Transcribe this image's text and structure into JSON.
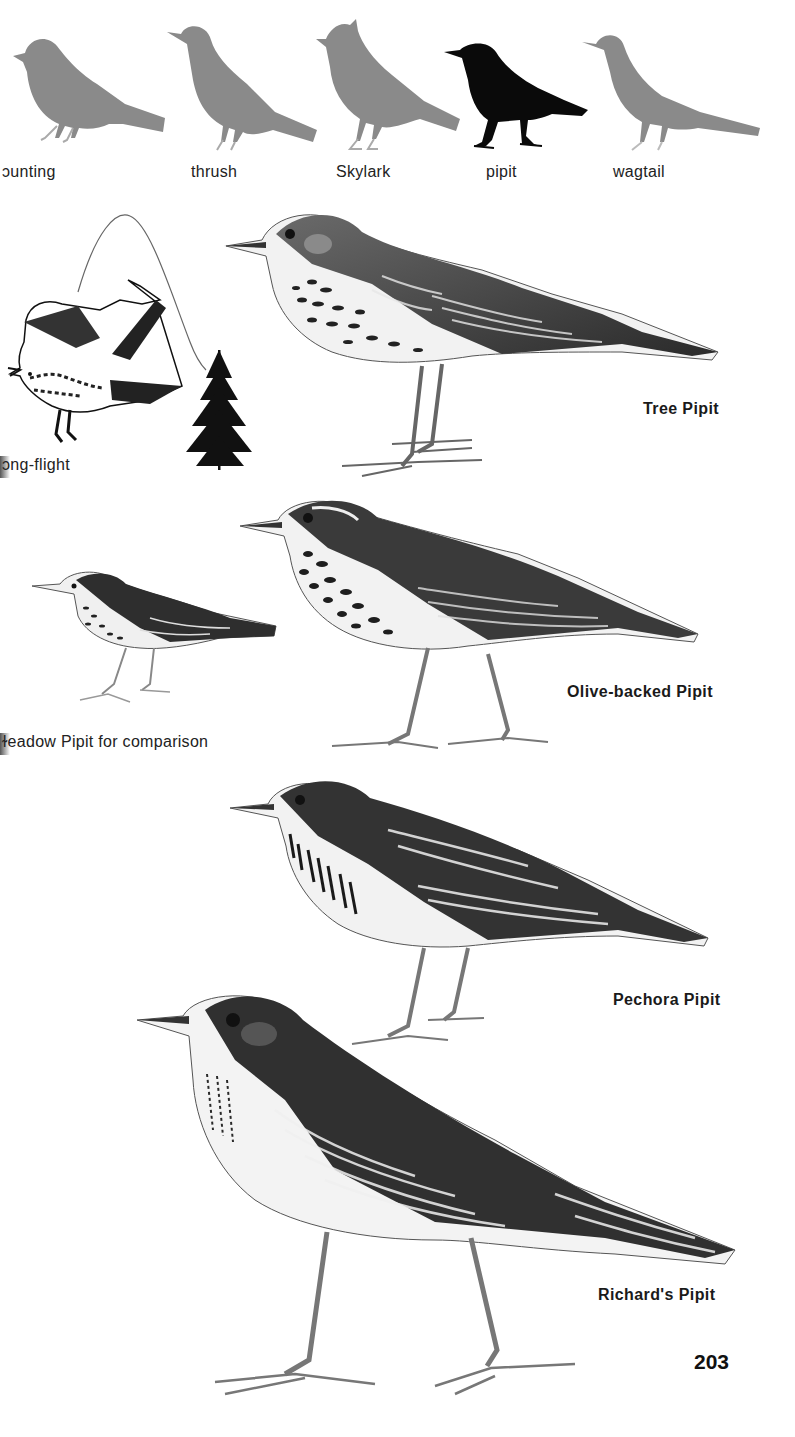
{
  "page": {
    "page_number": "203",
    "colors": {
      "background": "#ffffff",
      "silhouette_grey": "#8a8a8a",
      "silhouette_highlight": "#0a0a0a",
      "text": "#1a1a1a"
    }
  },
  "silhouettes": {
    "items": [
      {
        "label": "ɔunting",
        "highlighted": false
      },
      {
        "label": "thrush",
        "highlighted": false
      },
      {
        "label": "Skylark",
        "highlighted": false
      },
      {
        "label": "pipit",
        "highlighted": true
      },
      {
        "label": "wagtail",
        "highlighted": false
      }
    ]
  },
  "plates": {
    "song_flight_caption": "ɔng-flight",
    "comparison_caption": "ɫeadow Pipit for comparison",
    "species": [
      {
        "name": "Tree Pipit"
      },
      {
        "name": "Olive-backed Pipit"
      },
      {
        "name": "Pechora Pipit"
      },
      {
        "name": "Richard's Pipit"
      }
    ]
  }
}
